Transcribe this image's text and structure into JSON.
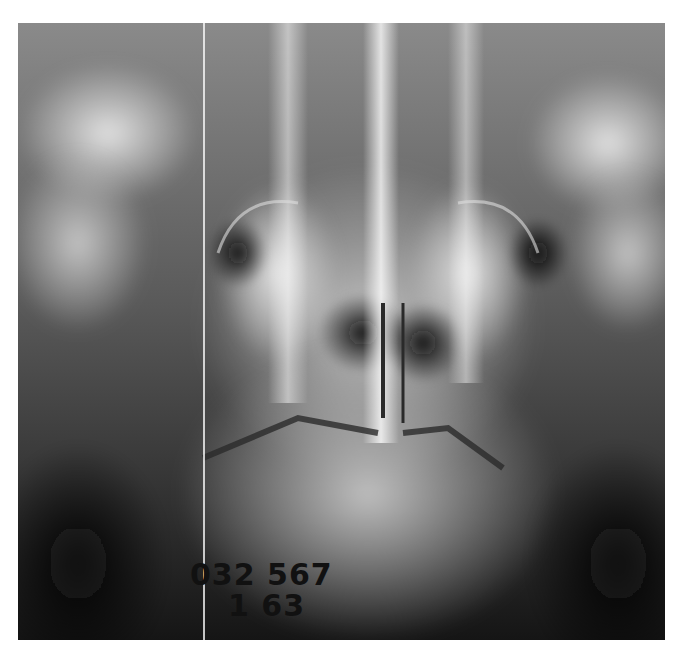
{
  "image": {
    "subject": "Frontal skull / cervical radiograph (open-mouth odontoid view)",
    "tone": "grayscale",
    "background": "#ffffff"
  },
  "film_label": {
    "line1": "032 567",
    "line2": "1 63"
  }
}
